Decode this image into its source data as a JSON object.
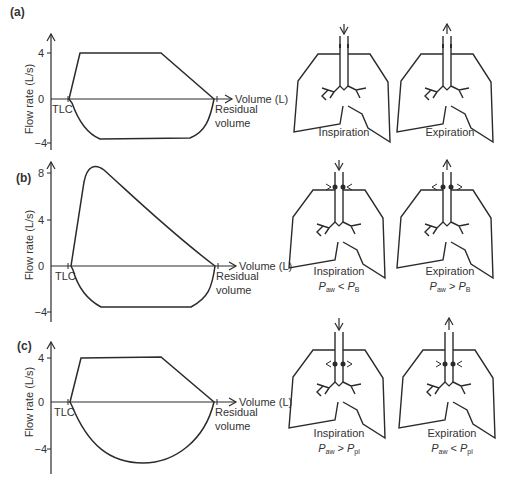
{
  "panels": [
    {
      "label": "(a)",
      "ylabel": "Flow rate (L/s)",
      "xlabel": "Volume (L)",
      "yticks": [
        "4",
        "0",
        "−4"
      ],
      "tlc_label": "TLC",
      "rv_label_1": "Residual",
      "rv_label_2": "volume",
      "insp_label": "Inspiration",
      "exp_label": "Expiration",
      "insp_eq": {
        "lhs_main": "",
        "lhs_sub": "",
        "op": "",
        "rhs_main": "",
        "rhs_sub": ""
      },
      "exp_eq": {
        "lhs_main": "",
        "lhs_sub": "",
        "op": "",
        "rhs_main": "",
        "rhs_sub": ""
      }
    },
    {
      "label": "(b)",
      "ylabel": "Flow rate (L/s)",
      "xlabel": "Volume (L)",
      "yticks": [
        "8",
        "4",
        "0",
        "−4"
      ],
      "tlc_label": "TLC",
      "rv_label_1": "Residual",
      "rv_label_2": "volume",
      "insp_label": "Inspiration",
      "exp_label": "Expiration",
      "insp_eq": {
        "lhs_main": "P",
        "lhs_sub": "aw",
        "op": " < ",
        "rhs_main": "P",
        "rhs_sub": "B"
      },
      "exp_eq": {
        "lhs_main": "P",
        "lhs_sub": "aw",
        "op": " > ",
        "rhs_main": "P",
        "rhs_sub": "B"
      }
    },
    {
      "label": "(c)",
      "ylabel": "Flow rate (L/s)",
      "xlabel": "Volume (L)",
      "yticks": [
        "4",
        "0",
        "−4"
      ],
      "tlc_label": "TLC",
      "rv_label_1": "Residual",
      "rv_label_2": "volume",
      "insp_label": "Inspiration",
      "exp_label": "Expiration",
      "insp_eq": {
        "lhs_main": "P",
        "lhs_sub": "aw",
        "op": " > ",
        "rhs_main": "P",
        "rhs_sub": "pl"
      },
      "exp_eq": {
        "lhs_main": "P",
        "lhs_sub": "aw",
        "op": " < ",
        "rhs_main": "P",
        "rhs_sub": "pl"
      }
    }
  ],
  "colors": {
    "stroke": "#2b2b2b",
    "text": "#333333"
  }
}
